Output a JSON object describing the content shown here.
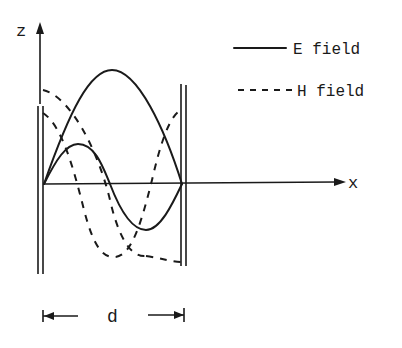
{
  "diagram": {
    "axes": {
      "vertical_label": "z",
      "horizontal_label": "x"
    },
    "legend": [
      {
        "style": "solid",
        "label": "E field"
      },
      {
        "style": "dashed",
        "label": "H field"
      }
    ],
    "dimension": {
      "label": "d"
    },
    "colors": {
      "ink": "#1a1a1a",
      "background": "#ffffff"
    }
  }
}
